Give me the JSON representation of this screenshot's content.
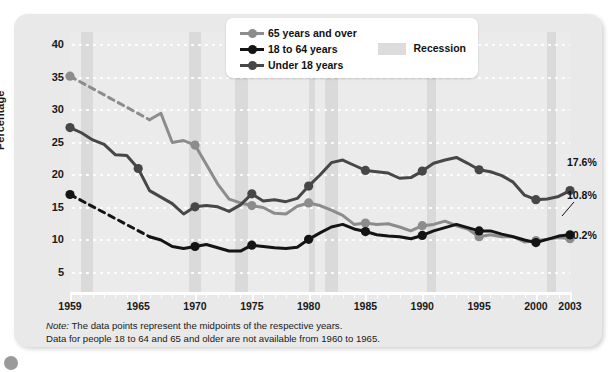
{
  "chart_data": {
    "type": "line",
    "title": "",
    "xlabel": "",
    "ylabel": "Percentage",
    "xlim": [
      1959,
      2003
    ],
    "ylim": [
      2,
      42
    ],
    "yticks": [
      5,
      10,
      15,
      20,
      25,
      30,
      35,
      40
    ],
    "xticks": [
      1959,
      1965,
      1970,
      1975,
      1980,
      1985,
      1990,
      1995,
      2000,
      2003
    ],
    "grid": "horizontal dotted white",
    "legend_position": "top-right",
    "series": [
      {
        "name": "65 years and over",
        "color": "#8c8c8c",
        "end_label": "10.2%",
        "x": [
          1959,
          1966,
          1967,
          1968,
          1969,
          1970,
          1971,
          1972,
          1973,
          1974,
          1975,
          1976,
          1977,
          1978,
          1979,
          1980,
          1981,
          1982,
          1983,
          1984,
          1985,
          1986,
          1987,
          1988,
          1989,
          1990,
          1991,
          1992,
          1993,
          1994,
          1995,
          1996,
          1997,
          1998,
          1999,
          2000,
          2001,
          2002,
          2003
        ],
        "y": [
          35.2,
          28.5,
          29.5,
          25.0,
          25.3,
          24.6,
          21.6,
          18.6,
          16.3,
          15.7,
          15.3,
          15.0,
          14.1,
          14.0,
          15.2,
          15.7,
          15.3,
          14.6,
          13.8,
          12.4,
          12.6,
          12.4,
          12.5,
          12.0,
          11.4,
          12.2,
          12.4,
          12.9,
          12.2,
          11.7,
          10.5,
          10.8,
          10.5,
          10.5,
          9.7,
          9.9,
          10.1,
          10.4,
          10.2
        ]
      },
      {
        "name": "18 to 64 years",
        "color": "#141414",
        "end_label": "10.8%",
        "x": [
          1959,
          1966,
          1967,
          1968,
          1969,
          1970,
          1971,
          1972,
          1973,
          1974,
          1975,
          1976,
          1977,
          1978,
          1979,
          1980,
          1981,
          1982,
          1983,
          1984,
          1985,
          1986,
          1987,
          1988,
          1989,
          1990,
          1991,
          1992,
          1993,
          1994,
          1995,
          1996,
          1997,
          1998,
          1999,
          2000,
          2001,
          2002,
          2003
        ],
        "y": [
          17.0,
          10.5,
          10.0,
          9.0,
          8.7,
          9.0,
          9.3,
          8.8,
          8.3,
          8.3,
          9.2,
          9.0,
          8.8,
          8.7,
          8.9,
          10.1,
          11.1,
          12.0,
          12.4,
          11.7,
          11.3,
          10.8,
          10.6,
          10.5,
          10.2,
          10.7,
          11.4,
          11.9,
          12.4,
          11.9,
          11.4,
          11.4,
          10.9,
          10.5,
          10.0,
          9.6,
          10.1,
          10.6,
          10.8
        ]
      },
      {
        "name": "Under 18 years",
        "color": "#474747",
        "end_label": "17.6%",
        "x": [
          1959,
          1960,
          1961,
          1962,
          1963,
          1964,
          1965,
          1966,
          1967,
          1968,
          1969,
          1970,
          1971,
          1972,
          1973,
          1974,
          1975,
          1976,
          1977,
          1978,
          1979,
          1980,
          1981,
          1982,
          1983,
          1984,
          1985,
          1986,
          1987,
          1988,
          1989,
          1990,
          1991,
          1992,
          1993,
          1994,
          1995,
          1996,
          1997,
          1998,
          1999,
          2000,
          2001,
          2002,
          2003
        ],
        "y": [
          27.3,
          26.5,
          25.4,
          24.7,
          23.1,
          23.0,
          21.0,
          17.6,
          16.6,
          15.6,
          14.0,
          15.1,
          15.3,
          15.1,
          14.4,
          15.4,
          17.1,
          16.0,
          16.2,
          15.9,
          16.4,
          18.3,
          20.0,
          21.9,
          22.3,
          21.5,
          20.7,
          20.5,
          20.3,
          19.5,
          19.6,
          20.6,
          21.8,
          22.3,
          22.7,
          21.8,
          20.8,
          20.5,
          19.9,
          18.9,
          16.9,
          16.2,
          16.3,
          16.7,
          17.6
        ]
      }
    ],
    "dashed_segments": [
      {
        "series": "65 years and over",
        "from_year": 1959,
        "to_year": 1966,
        "note": "data not available 1960-1965"
      },
      {
        "series": "18 to 64 years",
        "from_year": 1959,
        "to_year": 1966,
        "note": "data not available 1960-1965"
      }
    ],
    "recessions": [
      {
        "start": 1960.0,
        "end": 1961.0
      },
      {
        "start": 1969.5,
        "end": 1970.5
      },
      {
        "start": 1973.5,
        "end": 1974.7
      },
      {
        "start": 1980.0,
        "end": 1980.6
      },
      {
        "start": 1981.4,
        "end": 1982.6
      },
      {
        "start": 1990.4,
        "end": 1991.2
      },
      {
        "start": 2001.0,
        "end": 2001.8
      }
    ]
  },
  "legend": {
    "recession_label": "Recession",
    "items": [
      {
        "label": "65 years and over",
        "color": "#8c8c8c"
      },
      {
        "label": "18 to 64 years",
        "color": "#141414"
      },
      {
        "label": "Under 18 years",
        "color": "#474747"
      }
    ]
  },
  "axis": {
    "y_title": "Percentage",
    "y_ticks": [
      "40",
      "35",
      "30",
      "25",
      "20",
      "15",
      "10",
      "5"
    ],
    "x_ticks": [
      "1959",
      "1965",
      "1970",
      "1975",
      "1980",
      "1985",
      "1990",
      "1995",
      "2000",
      "2003"
    ]
  },
  "end_labels": {
    "under18": "17.6%",
    "adults": "10.8%",
    "seniors": "10.2%"
  },
  "note": {
    "prefix": "Note:",
    "line1": " The data points represent the midpoints of the respective years.",
    "line2": "Data for people 18 to 64 and 65 and older are not available from 1960 to 1965."
  },
  "colors": {
    "panel": "#e9e9e9",
    "plot_bg": "#ebebeb",
    "recession_band": "#dadada",
    "gridline": "#ffffff",
    "seniors": "#8c8c8c",
    "adults": "#141414",
    "under18": "#474747"
  }
}
